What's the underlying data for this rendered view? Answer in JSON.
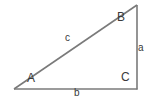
{
  "figure": {
    "kind": "right-triangle-diagram",
    "background_color": "#ffffff",
    "stroke_color": "#7a7a7a",
    "text_color": "#3a3a3a",
    "stroke_width": 1.6,
    "vertices": {
      "A": {
        "x": 14,
        "y": 89
      },
      "B": {
        "x": 137,
        "y": 5
      },
      "C": {
        "x": 137,
        "y": 89
      }
    },
    "vertex_labels": {
      "A": "A",
      "B": "B",
      "C": "C"
    },
    "side_labels": {
      "a": "a",
      "b": "b",
      "c": "c"
    }
  }
}
